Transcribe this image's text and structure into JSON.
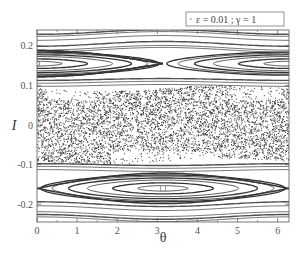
{
  "chart_data": {
    "type": "scatter",
    "title": "",
    "xlabel": "θ",
    "ylabel": "I",
    "xlim": [
      0,
      6.2832
    ],
    "ylim": [
      -0.245,
      0.24
    ],
    "xticks": [
      0,
      1,
      2,
      3,
      4,
      5,
      6
    ],
    "xtick_labels": [
      "0",
      "1",
      "2",
      "3",
      "4",
      "5",
      "6"
    ],
    "yticks": [
      0.2,
      0.1,
      0,
      -0.1,
      -0.2
    ],
    "ytick_labels": [
      "0.2",
      "0.1",
      "0",
      "-0.1",
      "-0.2"
    ],
    "grid": false,
    "legend": {
      "position": "top-right",
      "entries": [
        {
          "marker": "dot",
          "label": "ε = 0.01  ;  γ = 1"
        }
      ]
    },
    "islands": [
      {
        "center_theta": 0,
        "center_I": 0.155,
        "periodic": true,
        "half_width_I": 0.03
      },
      {
        "center_theta": 3.1416,
        "center_I": -0.16,
        "periodic": false,
        "half_width_I": 0.035
      }
    ],
    "chaotic_band": {
      "I_min": -0.092,
      "I_max": 0.092
    },
    "invariant_curves_I": [
      0.235,
      0.23,
      0.22,
      0.205,
      0.195,
      0.19,
      0.115,
      0.108,
      0.1,
      -0.1,
      -0.107,
      -0.115,
      -0.2,
      -0.21,
      -0.225,
      -0.232,
      -0.238
    ],
    "markers": [
      {
        "theta": 0,
        "I": 0.155,
        "shape": "open-circle"
      },
      {
        "theta": 0,
        "I": 0.075,
        "shape": "open-circle"
      },
      {
        "theta": 0,
        "I": 0.055,
        "shape": "open-circle"
      },
      {
        "theta": 3.1416,
        "I": -0.16,
        "shape": "open-square"
      }
    ]
  },
  "colors": {
    "ink": "#333333",
    "frame": "#555555",
    "background": "#ffffff"
  }
}
